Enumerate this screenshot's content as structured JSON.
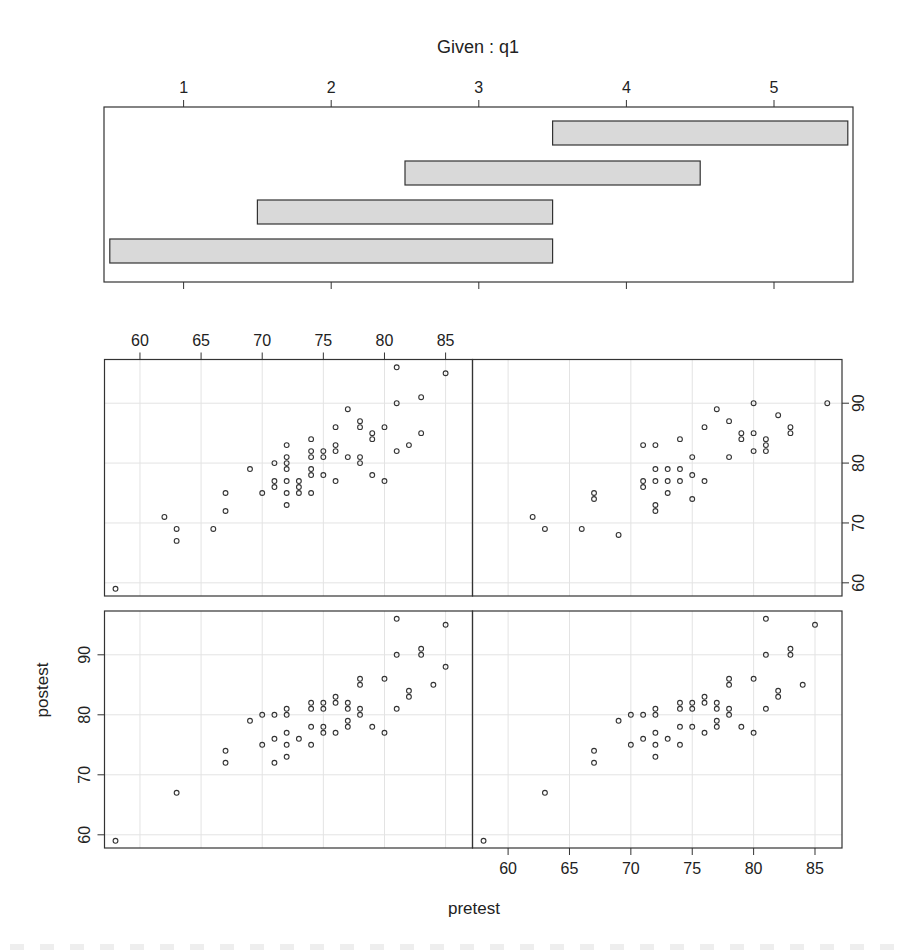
{
  "chart_data": [
    {
      "type": "bar",
      "subtype": "coplot-given-intervals",
      "title": "Given : q1",
      "xticks": [
        1,
        2,
        3,
        4,
        5
      ],
      "xlim": [
        0.45,
        5.5
      ],
      "intervals": [
        {
          "panel": 1,
          "from": 0.5,
          "to": 3.5
        },
        {
          "panel": 2,
          "from": 1.5,
          "to": 3.5
        },
        {
          "panel": 3,
          "from": 2.5,
          "to": 4.5
        },
        {
          "panel": 4,
          "from": 3.5,
          "to": 5.5
        }
      ],
      "bar_fill": "#d9d9d9"
    },
    {
      "type": "scatter",
      "xlabel": "pretest",
      "ylabel": "postest",
      "xticks": [
        60,
        65,
        70,
        75,
        80,
        85
      ],
      "yticks": [
        60,
        70,
        80,
        90
      ],
      "xlim": [
        57.1,
        87.2
      ],
      "ylim": [
        57.8,
        97.3
      ],
      "grid": true,
      "layout": "2x2",
      "panels": [
        {
          "name": "panel-1-bottom-left",
          "given_interval": [
            0.5,
            3.5
          ],
          "points": [
            [
              58,
              59
            ],
            [
              63,
              67
            ],
            [
              67,
              74
            ],
            [
              67,
              72
            ],
            [
              69,
              79
            ],
            [
              70,
              80
            ],
            [
              70,
              75
            ],
            [
              71,
              80
            ],
            [
              71,
              76
            ],
            [
              71,
              72
            ],
            [
              72,
              81
            ],
            [
              72,
              80
            ],
            [
              72,
              77
            ],
            [
              72,
              75
            ],
            [
              72,
              73
            ],
            [
              73,
              76
            ],
            [
              74,
              82
            ],
            [
              74,
              81
            ],
            [
              74,
              78
            ],
            [
              74,
              75
            ],
            [
              75,
              82
            ],
            [
              75,
              81
            ],
            [
              75,
              78
            ],
            [
              75,
              77
            ],
            [
              76,
              83
            ],
            [
              76,
              82
            ],
            [
              76,
              77
            ],
            [
              77,
              82
            ],
            [
              77,
              81
            ],
            [
              77,
              79
            ],
            [
              77,
              78
            ],
            [
              78,
              86
            ],
            [
              78,
              85
            ],
            [
              78,
              81
            ],
            [
              78,
              80
            ],
            [
              79,
              78
            ],
            [
              80,
              86
            ],
            [
              80,
              77
            ],
            [
              81,
              96
            ],
            [
              81,
              90
            ],
            [
              81,
              81
            ],
            [
              82,
              84
            ],
            [
              82,
              83
            ],
            [
              83,
              91
            ],
            [
              83,
              90
            ],
            [
              84,
              85
            ],
            [
              85,
              95
            ],
            [
              85,
              88
            ]
          ]
        },
        {
          "name": "panel-2-bottom-right",
          "given_interval": [
            1.5,
            3.5
          ],
          "points": [
            [
              58,
              59
            ],
            [
              63,
              67
            ],
            [
              67,
              74
            ],
            [
              67,
              72
            ],
            [
              69,
              79
            ],
            [
              70,
              80
            ],
            [
              70,
              75
            ],
            [
              71,
              80
            ],
            [
              71,
              76
            ],
            [
              72,
              81
            ],
            [
              72,
              80
            ],
            [
              72,
              77
            ],
            [
              72,
              75
            ],
            [
              72,
              73
            ],
            [
              73,
              76
            ],
            [
              74,
              82
            ],
            [
              74,
              81
            ],
            [
              74,
              78
            ],
            [
              74,
              75
            ],
            [
              75,
              82
            ],
            [
              75,
              81
            ],
            [
              75,
              78
            ],
            [
              76,
              83
            ],
            [
              76,
              82
            ],
            [
              76,
              77
            ],
            [
              77,
              82
            ],
            [
              77,
              81
            ],
            [
              77,
              79
            ],
            [
              77,
              78
            ],
            [
              78,
              86
            ],
            [
              78,
              85
            ],
            [
              78,
              81
            ],
            [
              78,
              80
            ],
            [
              79,
              78
            ],
            [
              80,
              86
            ],
            [
              80,
              77
            ],
            [
              81,
              96
            ],
            [
              81,
              90
            ],
            [
              81,
              81
            ],
            [
              82,
              84
            ],
            [
              82,
              83
            ],
            [
              83,
              91
            ],
            [
              83,
              90
            ],
            [
              84,
              85
            ],
            [
              85,
              95
            ]
          ]
        },
        {
          "name": "panel-3-top-left",
          "given_interval": [
            2.5,
            4.5
          ],
          "points": [
            [
              58,
              59
            ],
            [
              62,
              71
            ],
            [
              63,
              69
            ],
            [
              63,
              67
            ],
            [
              66,
              69
            ],
            [
              67,
              75
            ],
            [
              67,
              72
            ],
            [
              69,
              79
            ],
            [
              70,
              75
            ],
            [
              71,
              80
            ],
            [
              71,
              77
            ],
            [
              71,
              76
            ],
            [
              72,
              83
            ],
            [
              72,
              81
            ],
            [
              72,
              80
            ],
            [
              72,
              79
            ],
            [
              72,
              77
            ],
            [
              72,
              75
            ],
            [
              72,
              73
            ],
            [
              73,
              77
            ],
            [
              73,
              76
            ],
            [
              73,
              75
            ],
            [
              74,
              84
            ],
            [
              74,
              82
            ],
            [
              74,
              81
            ],
            [
              74,
              79
            ],
            [
              74,
              78
            ],
            [
              74,
              75
            ],
            [
              75,
              82
            ],
            [
              75,
              81
            ],
            [
              75,
              78
            ],
            [
              76,
              86
            ],
            [
              76,
              83
            ],
            [
              76,
              82
            ],
            [
              76,
              77
            ],
            [
              77,
              89
            ],
            [
              77,
              81
            ],
            [
              78,
              87
            ],
            [
              78,
              86
            ],
            [
              78,
              81
            ],
            [
              78,
              80
            ],
            [
              79,
              85
            ],
            [
              79,
              84
            ],
            [
              79,
              78
            ],
            [
              80,
              86
            ],
            [
              80,
              77
            ],
            [
              81,
              96
            ],
            [
              81,
              90
            ],
            [
              81,
              82
            ],
            [
              82,
              83
            ],
            [
              83,
              91
            ],
            [
              83,
              85
            ],
            [
              85,
              95
            ]
          ]
        },
        {
          "name": "panel-4-top-right",
          "given_interval": [
            3.5,
            5.5
          ],
          "points": [
            [
              62,
              71
            ],
            [
              63,
              69
            ],
            [
              66,
              69
            ],
            [
              67,
              75
            ],
            [
              67,
              74
            ],
            [
              69,
              68
            ],
            [
              71,
              83
            ],
            [
              71,
              77
            ],
            [
              71,
              76
            ],
            [
              72,
              83
            ],
            [
              72,
              79
            ],
            [
              72,
              77
            ],
            [
              72,
              73
            ],
            [
              72,
              72
            ],
            [
              73,
              79
            ],
            [
              73,
              77
            ],
            [
              73,
              75
            ],
            [
              74,
              84
            ],
            [
              74,
              79
            ],
            [
              74,
              77
            ],
            [
              75,
              81
            ],
            [
              75,
              78
            ],
            [
              75,
              74
            ],
            [
              76,
              86
            ],
            [
              76,
              77
            ],
            [
              77,
              89
            ],
            [
              78,
              87
            ],
            [
              78,
              81
            ],
            [
              79,
              85
            ],
            [
              79,
              84
            ],
            [
              80,
              90
            ],
            [
              80,
              85
            ],
            [
              80,
              82
            ],
            [
              81,
              84
            ],
            [
              81,
              83
            ],
            [
              81,
              82
            ],
            [
              82,
              88
            ],
            [
              83,
              86
            ],
            [
              83,
              85
            ],
            [
              86,
              90
            ]
          ]
        }
      ]
    }
  ],
  "labels": {
    "given_title": "Given : q1",
    "xlabel": "pretest",
    "ylabel": "postest"
  },
  "colors": {
    "frame": "#333333",
    "grid": "#e3e3e3",
    "points": "#333333",
    "bar_fill": "#d9d9d9",
    "text": "#222222"
  }
}
